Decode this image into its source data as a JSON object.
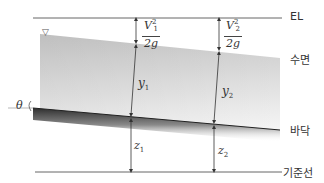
{
  "diagram": {
    "type": "open-channel-energy-diagram",
    "lines": {
      "energy_line": "EL",
      "water_surface": "수면",
      "channel_bed": "바닥",
      "datum": "기준선"
    },
    "section1": {
      "velocity_head_num": "V",
      "velocity_head_sup": "2",
      "velocity_head_sub": "1",
      "velocity_head_den": "2g",
      "depth": "y",
      "depth_sub": "1",
      "elevation": "z",
      "elevation_sub": "1"
    },
    "section2": {
      "velocity_head_num": "V",
      "velocity_head_sup": "2",
      "velocity_head_sub": "2",
      "velocity_head_den": "2g",
      "depth": "y",
      "depth_sub": "2",
      "elevation": "z",
      "elevation_sub": "2"
    },
    "angle": "θ",
    "water_surface_symbol": "▽",
    "colors": {
      "line": "#555555",
      "water_light": "#f4f4f4",
      "water_dark": "#c8c8c8",
      "bed_dark": "#333333",
      "text": "#333333"
    }
  }
}
